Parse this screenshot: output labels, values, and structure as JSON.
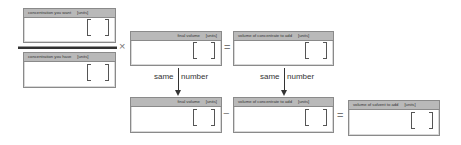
{
  "boxes": {
    "concentration_want": {
      "label": "concentration you want",
      "units": "[units]"
    },
    "concentration_have": {
      "label": "concentration you have",
      "units": "[units]"
    },
    "final_volume_top": {
      "label": "final volume",
      "units": "[units]"
    },
    "concentrate_volume_top": {
      "label": "volume of concentrate to add",
      "units": "[units]"
    },
    "final_volume_bottom": {
      "label": "final volume",
      "units": "[units]"
    },
    "concentrate_volume_bottom": {
      "label": "volume of concentrate to add",
      "units": "[units]"
    },
    "solvent_volume": {
      "label": "volume of solvent to add",
      "units": "[units]"
    }
  },
  "operators": {
    "multiply": "×",
    "equals_top": "=",
    "minus": "−",
    "equals_bottom": "="
  },
  "connectors": {
    "left": {
      "word1": "same",
      "word2": "number"
    },
    "right": {
      "word1": "same",
      "word2": "number"
    }
  }
}
